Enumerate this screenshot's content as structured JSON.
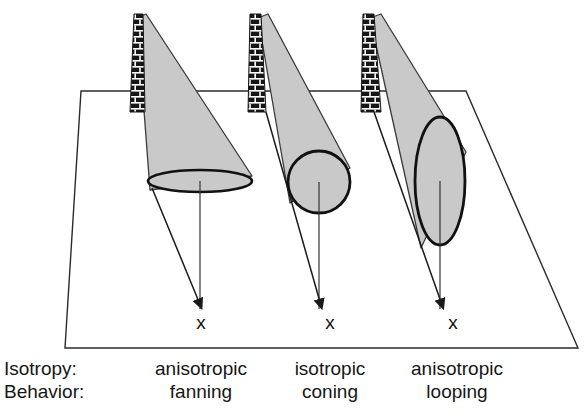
{
  "figure": {
    "ground_plane": {
      "name": "ground-plane",
      "points": "81,91 466,91 578,348 65,348",
      "stroke": "#2b2b2b"
    },
    "colors": {
      "plume_fill": "#c9c9c9",
      "plume_stroke": "#3a3a3a",
      "shape_outline": "#111111",
      "stack_dark": "#161616",
      "stack_light": "#ffffff",
      "text": "#161616",
      "arrow": "#1a1a1a",
      "background": "#ffffff"
    }
  },
  "plumes": [
    {
      "id": "plume-fanning",
      "stack": {
        "x": 130,
        "top": 14,
        "bottom": 112,
        "top_width": 9,
        "bottom_width": 14
      },
      "cone": "137,18 146,14 252,176 150,190",
      "shape": {
        "type": "ellipse",
        "cx": 200,
        "cy": 181,
        "rx": 52,
        "ry": 11
      },
      "centerline": {
        "x1": 200,
        "y1": 181,
        "x2": 200,
        "y2": 309
      },
      "arrow": {
        "x1": 152,
        "y1": 188,
        "x2": 199,
        "y2": 302
      },
      "marker": {
        "x": 201,
        "y": 329,
        "label": "x"
      }
    },
    {
      "id": "plume-coning",
      "stack": {
        "x": 248,
        "top": 14,
        "bottom": 112,
        "top_width": 11,
        "bottom_width": 18
      },
      "cone": "258,18 268,14 350,168 290,200",
      "shape": {
        "type": "circle",
        "cx": 319,
        "cy": 182,
        "r": 31
      },
      "centerline": {
        "x1": 319,
        "y1": 182,
        "x2": 319,
        "y2": 309
      },
      "arrow": {
        "x1": 266,
        "y1": 112,
        "x2": 320,
        "y2": 302
      },
      "marker": {
        "x": 330,
        "y": 329,
        "label": "x"
      }
    },
    {
      "id": "plume-looping",
      "stack": {
        "x": 361,
        "top": 14,
        "bottom": 112,
        "top_width": 11,
        "bottom_width": 20
      },
      "cone": "370,18 381,14 465,150 420,245",
      "shape": {
        "type": "ellipse",
        "cx": 440,
        "cy": 181,
        "rx": 25,
        "ry": 64
      },
      "centerline": {
        "x1": 440,
        "y1": 181,
        "x2": 440,
        "y2": 309
      },
      "arrow": {
        "x1": 374,
        "y1": 112,
        "x2": 441,
        "y2": 302
      },
      "marker": {
        "x": 453,
        "y": 329,
        "label": "x"
      }
    }
  ],
  "legend": {
    "rows": [
      {
        "name": "isotropy",
        "header": "Isotropy:",
        "values": [
          "anisotropic",
          "isotropic",
          "anisotropic"
        ]
      },
      {
        "name": "behavior",
        "header": "Behavior:",
        "values": [
          "fanning",
          "coning",
          "looping"
        ]
      }
    ],
    "columns_x": [
      201,
      330,
      453
    ],
    "header_x": 4,
    "row_y": [
      375,
      398
    ]
  }
}
